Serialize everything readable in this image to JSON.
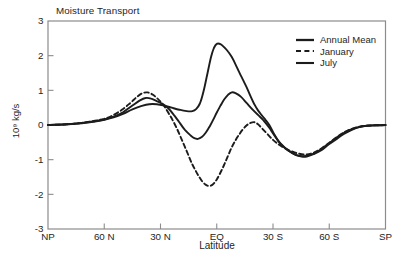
{
  "title": "Moisture Transport",
  "colors": {
    "line": "#1c1c1c",
    "frame": "#8c8c8c",
    "text": "#262626",
    "background": "#ffffff"
  },
  "axes": {
    "xlabel": "Latitude",
    "ylabel": "10⁹ kg/s",
    "ylim": [
      -3,
      3
    ],
    "xlim_lat": [
      90,
      -90
    ],
    "yticks": [
      {
        "v": 3,
        "label": "3",
        "tick": false
      },
      {
        "v": 2,
        "label": "2",
        "tick": true
      },
      {
        "v": 1,
        "label": "1",
        "tick": true
      },
      {
        "v": 0,
        "label": "0",
        "tick": true
      },
      {
        "v": -1,
        "label": "-1",
        "tick": true
      },
      {
        "v": -2,
        "label": "-2",
        "tick": true
      },
      {
        "v": -3,
        "label": "-3",
        "tick": false
      }
    ],
    "xticks": [
      {
        "lat": 90,
        "label": "NP",
        "tick": false
      },
      {
        "lat": 60,
        "label": "60 N",
        "tick": true
      },
      {
        "lat": 30,
        "label": "30 N",
        "tick": true
      },
      {
        "lat": 0,
        "label": "EQ",
        "tick": true
      },
      {
        "lat": -30,
        "label": "30 S",
        "tick": true
      },
      {
        "lat": -60,
        "label": "60 S",
        "tick": true
      },
      {
        "lat": -90,
        "label": "SP",
        "tick": false
      }
    ]
  },
  "legend": [
    {
      "label": "Annual Mean",
      "style": "solid"
    },
    {
      "label": "January",
      "style": "dashed"
    },
    {
      "label": "July",
      "style": "solid"
    }
  ],
  "chart_data": {
    "type": "line",
    "title": "Moisture Transport",
    "xlabel": "Latitude",
    "ylabel": "10⁹ kg/s",
    "x_unit": "degrees_latitude_north_positive",
    "y_unit": "1e9 kg/s",
    "grid": false,
    "legend_position": "upper right",
    "series": [
      {
        "name": "Annual Mean",
        "style": "solid",
        "points": [
          [
            90,
            0
          ],
          [
            80,
            0.02
          ],
          [
            72,
            0.06
          ],
          [
            65,
            0.11
          ],
          [
            60,
            0.16
          ],
          [
            55,
            0.24
          ],
          [
            50,
            0.37
          ],
          [
            45,
            0.56
          ],
          [
            41,
            0.71
          ],
          [
            38,
            0.78
          ],
          [
            35,
            0.76
          ],
          [
            32,
            0.69
          ],
          [
            29,
            0.61
          ],
          [
            26,
            0.49
          ],
          [
            23,
            0.3
          ],
          [
            20,
            0.08
          ],
          [
            17,
            -0.14
          ],
          [
            14,
            -0.3
          ],
          [
            12,
            -0.38
          ],
          [
            10,
            -0.4
          ],
          [
            8,
            -0.35
          ],
          [
            6,
            -0.23
          ],
          [
            4,
            -0.06
          ],
          [
            2,
            0.14
          ],
          [
            0,
            0.36
          ],
          [
            -2,
            0.56
          ],
          [
            -4,
            0.74
          ],
          [
            -6,
            0.87
          ],
          [
            -8,
            0.94
          ],
          [
            -10,
            0.92
          ],
          [
            -13,
            0.81
          ],
          [
            -16,
            0.63
          ],
          [
            -19,
            0.45
          ],
          [
            -22,
            0.29
          ],
          [
            -25,
            0.13
          ],
          [
            -28,
            -0.08
          ],
          [
            -31,
            -0.32
          ],
          [
            -34,
            -0.53
          ],
          [
            -38,
            -0.73
          ],
          [
            -42,
            -0.86
          ],
          [
            -46,
            -0.9
          ],
          [
            -50,
            -0.86
          ],
          [
            -54,
            -0.76
          ],
          [
            -58,
            -0.61
          ],
          [
            -62,
            -0.44
          ],
          [
            -66,
            -0.29
          ],
          [
            -70,
            -0.16
          ],
          [
            -75,
            -0.07
          ],
          [
            -80,
            -0.02
          ],
          [
            -85,
            -0.01
          ],
          [
            -90,
            0
          ]
        ]
      },
      {
        "name": "January",
        "style": "dashed",
        "points": [
          [
            90,
            0
          ],
          [
            80,
            0.02
          ],
          [
            72,
            0.06
          ],
          [
            65,
            0.12
          ],
          [
            60,
            0.18
          ],
          [
            55,
            0.29
          ],
          [
            50,
            0.46
          ],
          [
            46,
            0.64
          ],
          [
            43,
            0.79
          ],
          [
            40,
            0.91
          ],
          [
            37,
            0.94
          ],
          [
            34,
            0.87
          ],
          [
            31,
            0.73
          ],
          [
            28,
            0.54
          ],
          [
            25,
            0.28
          ],
          [
            22,
            -0.02
          ],
          [
            19,
            -0.38
          ],
          [
            16,
            -0.76
          ],
          [
            13,
            -1.14
          ],
          [
            10,
            -1.44
          ],
          [
            8,
            -1.61
          ],
          [
            6,
            -1.72
          ],
          [
            4,
            -1.76
          ],
          [
            2,
            -1.71
          ],
          [
            0,
            -1.57
          ],
          [
            -2,
            -1.37
          ],
          [
            -4,
            -1.14
          ],
          [
            -6,
            -0.89
          ],
          [
            -8,
            -0.64
          ],
          [
            -10,
            -0.44
          ],
          [
            -12,
            -0.27
          ],
          [
            -14,
            -0.12
          ],
          [
            -16,
            -0.01
          ],
          [
            -18,
            0.06
          ],
          [
            -20,
            0.08
          ],
          [
            -22,
            0.02
          ],
          [
            -24,
            -0.09
          ],
          [
            -27,
            -0.26
          ],
          [
            -30,
            -0.43
          ],
          [
            -33,
            -0.56
          ],
          [
            -36,
            -0.66
          ],
          [
            -40,
            -0.76
          ],
          [
            -44,
            -0.83
          ],
          [
            -48,
            -0.85
          ],
          [
            -52,
            -0.79
          ],
          [
            -56,
            -0.67
          ],
          [
            -60,
            -0.51
          ],
          [
            -64,
            -0.35
          ],
          [
            -68,
            -0.21
          ],
          [
            -72,
            -0.11
          ],
          [
            -76,
            -0.05
          ],
          [
            -80,
            -0.02
          ],
          [
            -85,
            -0.01
          ],
          [
            -90,
            0
          ]
        ]
      },
      {
        "name": "July",
        "style": "solid",
        "points": [
          [
            90,
            0
          ],
          [
            80,
            0.02
          ],
          [
            72,
            0.05
          ],
          [
            65,
            0.1
          ],
          [
            60,
            0.15
          ],
          [
            55,
            0.22
          ],
          [
            50,
            0.32
          ],
          [
            45,
            0.45
          ],
          [
            40,
            0.55
          ],
          [
            36,
            0.6
          ],
          [
            32,
            0.6
          ],
          [
            28,
            0.56
          ],
          [
            24,
            0.5
          ],
          [
            20,
            0.44
          ],
          [
            16,
            0.4
          ],
          [
            13,
            0.4
          ],
          [
            11,
            0.46
          ],
          [
            9,
            0.62
          ],
          [
            7,
            0.98
          ],
          [
            5,
            1.48
          ],
          [
            3,
            1.97
          ],
          [
            1.5,
            2.22
          ],
          [
            0,
            2.34
          ],
          [
            -2,
            2.33
          ],
          [
            -4,
            2.24
          ],
          [
            -6,
            2.12
          ],
          [
            -8,
            1.96
          ],
          [
            -10,
            1.75
          ],
          [
            -12,
            1.52
          ],
          [
            -14,
            1.3
          ],
          [
            -16,
            1.08
          ],
          [
            -18,
            0.83
          ],
          [
            -20,
            0.6
          ],
          [
            -22,
            0.42
          ],
          [
            -24,
            0.28
          ],
          [
            -26,
            0.15
          ],
          [
            -28,
            0
          ],
          [
            -30,
            -0.2
          ],
          [
            -33,
            -0.48
          ],
          [
            -36,
            -0.65
          ],
          [
            -40,
            -0.8
          ],
          [
            -44,
            -0.9
          ],
          [
            -48,
            -0.91
          ],
          [
            -52,
            -0.83
          ],
          [
            -56,
            -0.72
          ],
          [
            -60,
            -0.55
          ],
          [
            -64,
            -0.4
          ],
          [
            -68,
            -0.25
          ],
          [
            -72,
            -0.14
          ],
          [
            -76,
            -0.06
          ],
          [
            -80,
            -0.02
          ],
          [
            -85,
            -0.01
          ],
          [
            -90,
            0
          ]
        ]
      }
    ]
  }
}
